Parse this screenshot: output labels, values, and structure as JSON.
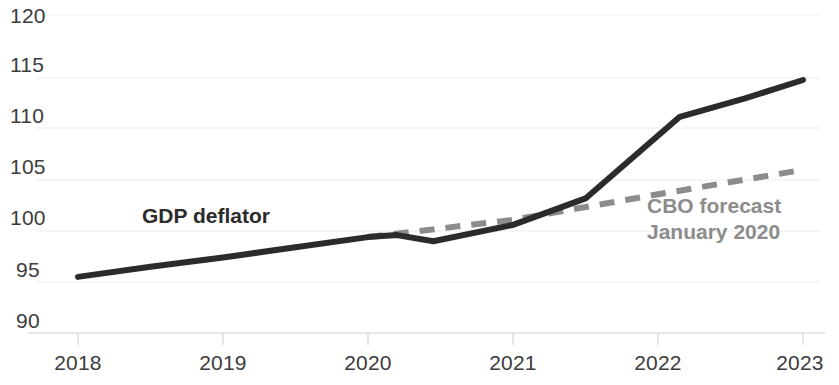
{
  "chart_data": {
    "type": "line",
    "title": "",
    "subtitle": "",
    "xlabel": "",
    "ylabel": "",
    "xlim": [
      2018,
      2023
    ],
    "ylim": [
      90,
      120
    ],
    "grid": true,
    "grid_axis": "y",
    "legend": "inline-annotations",
    "x_ticks": [
      "2018",
      "2019",
      "2020",
      "2021",
      "2022",
      "2023"
    ],
    "y_ticks": [
      "120",
      "115",
      "110",
      "105",
      "100",
      "95",
      "90"
    ],
    "series": [
      {
        "name": "GDP deflator",
        "style": "solid",
        "color": "#2b2b2b",
        "x": [
          2018.0,
          2018.5,
          2019.0,
          2019.5,
          2020.0,
          2020.2,
          2020.45,
          2021.0,
          2021.5,
          2022.15,
          2022.6,
          2023.0
        ],
        "values": [
          95.5,
          96.5,
          97.4,
          98.4,
          99.4,
          99.6,
          99.0,
          100.6,
          103.2,
          111.2,
          113.0,
          114.8
        ]
      },
      {
        "name": "CBO forecast January 2020",
        "style": "dashed",
        "color": "#8c8c8c",
        "x": [
          2020.0,
          2021.0,
          2022.0,
          2023.0
        ],
        "values": [
          99.4,
          101.1,
          103.6,
          106.0
        ]
      }
    ],
    "annotations": [
      {
        "id": "gdp-deflator",
        "text": "GDP deflator",
        "color": "#2b2b2b"
      },
      {
        "id": "cbo-forecast",
        "line1": "CBO forecast",
        "line2": "January 2020",
        "color": "#8c8c8c"
      }
    ]
  },
  "axes": {
    "y_ticks": [
      {
        "label": "120",
        "value": 120
      },
      {
        "label": "115",
        "value": 115
      },
      {
        "label": "110",
        "value": 110
      },
      {
        "label": "105",
        "value": 105
      },
      {
        "label": "100",
        "value": 100
      },
      {
        "label": "95",
        "value": 95
      },
      {
        "label": "90",
        "value": 90
      }
    ],
    "x_ticks": [
      {
        "label": "2018",
        "value": 2018
      },
      {
        "label": "2019",
        "value": 2019
      },
      {
        "label": "2020",
        "value": 2020
      },
      {
        "label": "2021",
        "value": 2021
      },
      {
        "label": "2022",
        "value": 2022
      },
      {
        "label": "2023",
        "value": 2023
      }
    ]
  },
  "annotations": {
    "gdp_deflator_label": "GDP deflator",
    "cbo_forecast_line1": "CBO forecast",
    "cbo_forecast_line2": "January 2020"
  },
  "colors": {
    "actual_line": "#2b2b2b",
    "forecast_line": "#8c8c8c",
    "gridline": "#ececec",
    "axis_line": "#dcdcdc",
    "tick_text": "#3c3c3c",
    "background": "#ffffff"
  }
}
